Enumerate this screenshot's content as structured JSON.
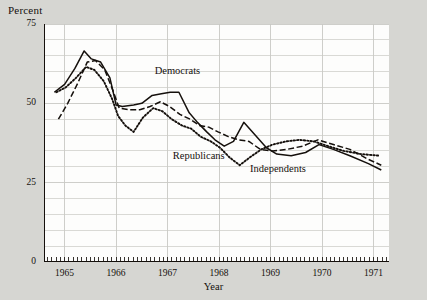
{
  "figure": {
    "background_color": "#d6d6d2",
    "panel_color": "#fdfdfc",
    "axis_color": "#15100c",
    "grid_color": "#c9c9c4"
  },
  "chart_data": {
    "type": "line",
    "title": "",
    "subtitle": "",
    "xlabel": "Year",
    "ylabel": "Percent",
    "ylim": [
      0,
      75
    ],
    "xlim": [
      1964.6,
      1971.3
    ],
    "grid": true,
    "legend_position": "inline-annotations",
    "ytick_labels": [
      "75",
      "50",
      "25",
      "0"
    ],
    "ytick_values": [
      75,
      50,
      25,
      0
    ],
    "ygrid_step": 5,
    "xtick_labels": [
      "1965",
      "1966",
      "1967",
      "1968",
      "1969",
      "1970",
      "1971"
    ],
    "xtick_values": [
      1965,
      1966,
      1967,
      1968,
      1969,
      1970,
      1971
    ],
    "xminor_ticks": "monthly",
    "annotations": [
      {
        "text": "Democrats",
        "x": 1966.75,
        "y": 60,
        "name": "democrats-label"
      },
      {
        "text": "Republicans",
        "x": 1967.1,
        "y": 33,
        "name": "republicans-label"
      },
      {
        "text": "Independents",
        "x": 1968.6,
        "y": 29,
        "name": "independents-label"
      }
    ],
    "series": [
      {
        "name": "Democrats",
        "style": "solid",
        "color": "#15100c",
        "points": [
          [
            1964.8,
            53.5
          ],
          [
            1965.0,
            56.0
          ],
          [
            1965.2,
            61.0
          ],
          [
            1965.38,
            66.5
          ],
          [
            1965.52,
            64.0
          ],
          [
            1965.7,
            63.0
          ],
          [
            1965.88,
            58.0
          ],
          [
            1966.0,
            49.5
          ],
          [
            1966.12,
            49.0
          ],
          [
            1966.34,
            49.5
          ],
          [
            1966.5,
            50.0
          ],
          [
            1966.7,
            52.5
          ],
          [
            1966.88,
            53.0
          ],
          [
            1967.05,
            53.5
          ],
          [
            1967.22,
            53.5
          ],
          [
            1967.42,
            47.0
          ],
          [
            1967.58,
            44.0
          ],
          [
            1967.76,
            41.0
          ],
          [
            1967.92,
            38.5
          ],
          [
            1968.1,
            36.5
          ],
          [
            1968.28,
            38.0
          ],
          [
            1968.48,
            44.0
          ],
          [
            1968.7,
            40.0
          ],
          [
            1968.92,
            36.0
          ],
          [
            1969.12,
            34.0
          ],
          [
            1969.4,
            33.5
          ],
          [
            1969.68,
            34.5
          ],
          [
            1969.94,
            37.0
          ],
          [
            1970.22,
            35.5
          ],
          [
            1970.54,
            33.5
          ],
          [
            1970.9,
            31.0
          ],
          [
            1971.15,
            29.0
          ]
        ]
      },
      {
        "name": "Republicans",
        "style": "dotted",
        "color": "#15100c",
        "points": [
          [
            1964.84,
            53.5
          ],
          [
            1965.02,
            55.0
          ],
          [
            1965.22,
            58.0
          ],
          [
            1965.42,
            61.5
          ],
          [
            1965.58,
            60.5
          ],
          [
            1965.76,
            57.0
          ],
          [
            1965.92,
            51.5
          ],
          [
            1966.04,
            46.0
          ],
          [
            1966.18,
            43.0
          ],
          [
            1966.34,
            41.0
          ],
          [
            1966.52,
            45.5
          ],
          [
            1966.72,
            48.5
          ],
          [
            1966.9,
            47.5
          ],
          [
            1967.08,
            45.0
          ],
          [
            1967.28,
            43.0
          ],
          [
            1967.46,
            42.0
          ],
          [
            1967.64,
            39.5
          ],
          [
            1967.84,
            38.0
          ],
          [
            1968.02,
            36.0
          ],
          [
            1968.2,
            33.0
          ],
          [
            1968.4,
            30.5
          ],
          [
            1968.6,
            33.0
          ],
          [
            1968.82,
            35.5
          ],
          [
            1969.04,
            37.0
          ],
          [
            1969.3,
            38.0
          ],
          [
            1969.56,
            38.5
          ],
          [
            1969.84,
            38.0
          ],
          [
            1970.12,
            36.5
          ],
          [
            1970.42,
            35.0
          ],
          [
            1970.76,
            34.0
          ],
          [
            1971.12,
            33.5
          ]
        ]
      },
      {
        "name": "Independents",
        "style": "dashed",
        "color": "#15100c",
        "points": [
          [
            1964.88,
            45.0
          ],
          [
            1965.06,
            50.0
          ],
          [
            1965.26,
            56.5
          ],
          [
            1965.44,
            63.0
          ],
          [
            1965.6,
            63.5
          ],
          [
            1965.78,
            60.5
          ],
          [
            1965.94,
            54.0
          ],
          [
            1966.06,
            48.5
          ],
          [
            1966.26,
            48.0
          ],
          [
            1966.46,
            48.0
          ],
          [
            1966.66,
            49.0
          ],
          [
            1966.86,
            50.5
          ],
          [
            1967.04,
            49.0
          ],
          [
            1967.24,
            46.5
          ],
          [
            1967.44,
            45.0
          ],
          [
            1967.62,
            43.0
          ],
          [
            1967.8,
            42.5
          ],
          [
            1967.98,
            41.0
          ],
          [
            1968.18,
            39.5
          ],
          [
            1968.38,
            38.5
          ],
          [
            1968.58,
            38.0
          ],
          [
            1968.8,
            35.5
          ],
          [
            1969.04,
            35.0
          ],
          [
            1969.32,
            35.5
          ],
          [
            1969.62,
            36.5
          ],
          [
            1969.92,
            38.5
          ],
          [
            1970.22,
            37.0
          ],
          [
            1970.54,
            35.5
          ],
          [
            1970.88,
            32.5
          ],
          [
            1971.15,
            30.5
          ]
        ]
      }
    ]
  },
  "watermark": {
    "text": ""
  }
}
